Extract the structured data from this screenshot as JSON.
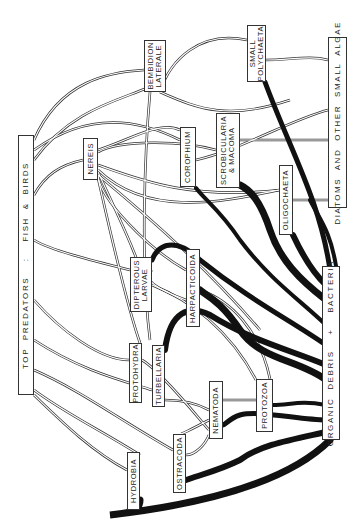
{
  "diagram": {
    "colors": {
      "ink": "#222222",
      "flow_heavy": "#111111",
      "background": "#ffffff"
    },
    "nodes": [
      {
        "id": "top_predators",
        "label": "TOP PREDATORS  :  FISH & BIRDS",
        "x": 18,
        "y": 135,
        "w": 16,
        "h": 260,
        "big": true
      },
      {
        "id": "bembidion",
        "label": "BEMBIDION\nLATERALE",
        "x": 144,
        "y": 40,
        "w": 22,
        "h": 52
      },
      {
        "id": "nereis",
        "label": "NEREIS",
        "x": 83,
        "y": 138,
        "w": 15,
        "h": 42
      },
      {
        "id": "corophium",
        "label": "COROPHIUM",
        "x": 180,
        "y": 127,
        "w": 16,
        "h": 60
      },
      {
        "id": "scrobicularia",
        "label": "SCROBICULARIA\n& MACOMA",
        "x": 216,
        "y": 113,
        "w": 24,
        "h": 75
      },
      {
        "id": "small_polychaeta",
        "label": "SMALL\nPOLYCHAETA",
        "x": 247,
        "y": 25,
        "w": 19,
        "h": 57
      },
      {
        "id": "diatoms",
        "label": "DIATOMS AND OTHER SMALL ALGAE",
        "x": 328,
        "y": 37,
        "w": 19,
        "h": 171,
        "big": true
      },
      {
        "id": "oligochaeta",
        "label": "OLIGOCHAETA",
        "x": 279,
        "y": 165,
        "w": 14,
        "h": 70
      },
      {
        "id": "dipterous",
        "label": "DIPTEROUS\nLARVAE",
        "x": 130,
        "y": 257,
        "w": 22,
        "h": 55
      },
      {
        "id": "harpacticoida",
        "label": "HARPACTICOIDA",
        "x": 186,
        "y": 249,
        "w": 14,
        "h": 78
      },
      {
        "id": "protohydra",
        "label": "PROTOHYDRA",
        "x": 129,
        "y": 343,
        "w": 13,
        "h": 60
      },
      {
        "id": "turbellaria",
        "label": "TURBELLARIA",
        "x": 152,
        "y": 345,
        "w": 13,
        "h": 62
      },
      {
        "id": "nematoda",
        "label": "NEMATODA",
        "x": 209,
        "y": 381,
        "w": 14,
        "h": 58
      },
      {
        "id": "protozoa",
        "label": "PROTOZOA",
        "x": 256,
        "y": 379,
        "w": 17,
        "h": 53
      },
      {
        "id": "ostracoda",
        "label": "OSTRACODA",
        "x": 173,
        "y": 434,
        "w": 13,
        "h": 59
      },
      {
        "id": "hydrobia",
        "label": "HYDROBIA",
        "x": 127,
        "y": 452,
        "w": 13,
        "h": 58
      },
      {
        "id": "organic_debris",
        "label": "ORGANIC DEBRIS  +  BACTERIA",
        "x": 322,
        "y": 266,
        "w": 18,
        "h": 174,
        "big": true
      }
    ],
    "heavy_flows": [
      "M330,440 C300,470 240,500 110,515 C135,513 140,508 140,500",
      "M326,432 C290,440 260,445 240,460 C220,470 200,475 186,480",
      "M326,420 C300,420 260,410 240,415 C230,418 225,425 223,425",
      "M326,405 C300,400 290,405 273,405",
      "M326,380 C300,360 260,360 240,330 C220,300 205,295 200,290",
      "M326,365 C290,350 250,340 210,315 C190,305 170,310 165,350",
      "M326,345 C290,320 250,300 200,260 C180,240 160,240 152,260",
      "M326,325 C300,300 270,280 240,240 C220,210 205,200 196,188",
      "M326,300 C300,280 280,260 270,230 C260,200 250,190 240,185",
      "M326,285 C310,270 300,250 293,235",
      "M330,270 C320,200 290,150 265,82",
      "M336,266 C330,230 320,220 310,200"
    ],
    "light_flows": [
      "M144,70 C110,72 60,80 34,140",
      "M147,88 C120,100 70,110 34,160",
      "M150,92 C145,150 140,260 150,340",
      "M160,92 C200,110 230,120 290,100",
      "M83,160 C60,165 45,175 34,195",
      "M98,150 C130,140 160,120 180,130",
      "M98,165 C140,180 190,200 280,190",
      "M98,175 C140,210 200,260 260,330",
      "M98,178 C110,230 125,300 140,343",
      "M98,172 C120,220 140,260 150,300",
      "M180,140 C140,120 90,110 34,150",
      "M196,160 C240,150 290,120 328,110",
      "M216,150 C180,140 120,140 98,152",
      "M240,140 C270,140 300,140 328,140",
      "M266,60 C290,60 310,55 328,60",
      "M247,40 C200,30 170,60 160,92",
      "M293,200 C310,200 320,200 328,200",
      "M279,190 C230,200 150,220 98,170",
      "M130,270 C90,260 50,250 34,240",
      "M152,285 C190,300 230,330 256,380",
      "M186,300 C160,290 140,280 152,270",
      "M200,290 C230,300 260,330 270,379",
      "M186,270 C150,250 100,200 98,175",
      "M129,360 C100,360 60,330 34,300",
      "M142,360 C160,370 200,420 209,430",
      "M152,390 C120,380 80,370 34,340",
      "M165,400 C185,400 200,405 209,410",
      "M173,450 C120,420 80,390 34,370",
      "M186,455 C195,455 205,445 209,435",
      "M127,470 C90,450 60,420 34,395",
      "M140,455 C100,430 60,410 34,390",
      "M223,400 C240,400 250,400 256,400",
      "M209,420 C190,430 180,435 180,434"
    ]
  }
}
